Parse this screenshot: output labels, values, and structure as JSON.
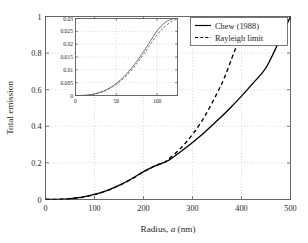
{
  "chart_data": {
    "type": "line",
    "title": "",
    "xlabel": "Radius, a (nm)",
    "xlabel_parts": {
      "prefix": "Radius, ",
      "italic": "a",
      "suffix": " (nm)"
    },
    "ylabel": "Total emission",
    "xlim": [
      0,
      500
    ],
    "ylim": [
      0,
      1
    ],
    "xticks": [
      "0",
      "100",
      "200",
      "300",
      "400",
      "500"
    ],
    "xtick_values": [
      0,
      100,
      200,
      300,
      400,
      500
    ],
    "yticks": [
      "0",
      "0.2",
      "0.4",
      "0.6",
      "0.8",
      "1"
    ],
    "ytick_values": [
      0,
      0.2,
      0.4,
      0.6,
      0.8,
      1
    ],
    "grid": true,
    "legend_position": "top-right",
    "series": [
      {
        "name": "Chew (1988)",
        "style": "solid",
        "color": "#000000",
        "x": [
          0,
          25,
          50,
          75,
          100,
          125,
          150,
          175,
          200,
          225,
          240,
          250,
          275,
          300,
          325,
          350,
          375,
          400,
          425,
          450,
          475,
          500
        ],
        "y": [
          0,
          0.0008,
          0.0045,
          0.013,
          0.028,
          0.049,
          0.077,
          0.112,
          0.152,
          0.185,
          0.2,
          0.212,
          0.26,
          0.312,
          0.368,
          0.43,
          0.495,
          0.565,
          0.64,
          0.72,
          0.855,
          1.0
        ]
      },
      {
        "name": "Rayleigh limit",
        "style": "dashed",
        "color": "#000000",
        "x": [
          0,
          25,
          50,
          75,
          100,
          125,
          150,
          175,
          200,
          225,
          240,
          250,
          275,
          300,
          325,
          350,
          365,
          380,
          390
        ],
        "y": [
          0,
          0.0009,
          0.0042,
          0.012,
          0.027,
          0.048,
          0.076,
          0.111,
          0.151,
          0.186,
          0.2,
          0.218,
          0.278,
          0.355,
          0.455,
          0.58,
          0.665,
          0.77,
          0.84
        ]
      }
    ]
  },
  "inset_chart_data": {
    "type": "line",
    "xlabel": "",
    "ylabel": "",
    "xlim": [
      0,
      125
    ],
    "ylim": [
      0,
      0.03
    ],
    "xticks": [
      "0",
      "50",
      "100"
    ],
    "xtick_values": [
      0,
      50,
      100
    ],
    "yticks": [
      "0",
      "0.005",
      "0.01",
      "0.015",
      "0.02",
      "0.025",
      "0.03"
    ],
    "ytick_values": [
      0,
      0.005,
      0.01,
      0.015,
      0.02,
      0.025,
      0.03
    ],
    "grid": true,
    "series": [
      {
        "name": "Chew (1988)",
        "style": "solid",
        "color": "#58595b",
        "x": [
          0,
          10,
          20,
          30,
          40,
          50,
          60,
          70,
          80,
          90,
          100,
          110,
          120,
          125
        ],
        "y": [
          0,
          5e-05,
          0.0004,
          0.0012,
          0.0026,
          0.0047,
          0.0075,
          0.0112,
          0.0155,
          0.0203,
          0.0252,
          0.0285,
          0.0299,
          0.03
        ]
      },
      {
        "name": "Rayleigh limit",
        "style": "dashed",
        "color": "#58595b",
        "x": [
          0,
          10,
          20,
          30,
          40,
          50,
          60,
          70,
          80,
          90,
          100,
          110,
          120,
          125
        ],
        "y": [
          0,
          4e-05,
          0.00036,
          0.0011,
          0.0024,
          0.0044,
          0.007,
          0.0104,
          0.0145,
          0.019,
          0.0236,
          0.027,
          0.0292,
          0.0298
        ]
      }
    ]
  },
  "legend": {
    "entries": [
      {
        "label": "Chew (1988)",
        "style": "solid"
      },
      {
        "label": "Rayleigh limit",
        "style": "dashed"
      }
    ]
  },
  "colors": {
    "axis": "#58595b",
    "grid": "#bcbec0",
    "curve": "#000000",
    "inset_curve": "#58595b",
    "background": "#ffffff"
  }
}
